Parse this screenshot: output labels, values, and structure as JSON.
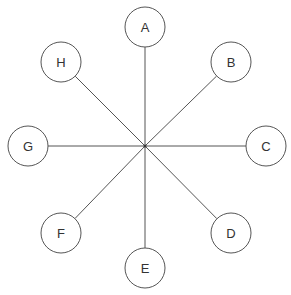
{
  "diagram": {
    "type": "star",
    "hub": {
      "x": 145,
      "y": 146
    },
    "radius": 20,
    "nodes": [
      {
        "id": "A",
        "label": "A",
        "x": 145,
        "y": 27
      },
      {
        "id": "B",
        "label": "B",
        "x": 231,
        "y": 62
      },
      {
        "id": "C",
        "label": "C",
        "x": 266,
        "y": 146
      },
      {
        "id": "D",
        "label": "D",
        "x": 231,
        "y": 233
      },
      {
        "id": "E",
        "label": "E",
        "x": 145,
        "y": 268
      },
      {
        "id": "F",
        "label": "F",
        "x": 61,
        "y": 233
      },
      {
        "id": "G",
        "label": "G",
        "x": 28,
        "y": 146
      },
      {
        "id": "H",
        "label": "H",
        "x": 61,
        "y": 62
      }
    ],
    "colors": {
      "stroke": "#555555",
      "text": "#333333",
      "background": "#ffffff"
    }
  }
}
